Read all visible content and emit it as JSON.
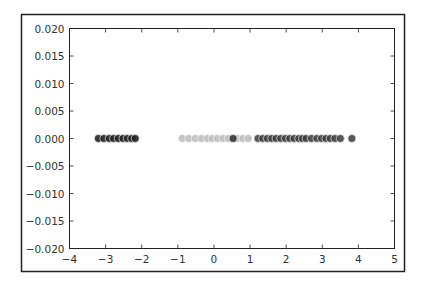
{
  "chart_data": {
    "type": "scatter",
    "title": "",
    "xlabel": "",
    "ylabel": "",
    "xlim": [
      -4,
      5
    ],
    "ylim": [
      -0.02,
      0.02
    ],
    "grid": false,
    "legend": "none",
    "xticks": [
      -4,
      -3,
      -2,
      -1,
      0,
      1,
      2,
      3,
      4,
      5
    ],
    "xtick_labels": [
      "−4",
      "−3",
      "−2",
      "−1",
      "0",
      "1",
      "2",
      "3",
      "4",
      "5"
    ],
    "yticks": [
      -0.02,
      -0.015,
      -0.01,
      -0.005,
      0,
      0.005,
      0.01,
      0.015,
      0.02
    ],
    "ytick_labels": [
      "−0.020",
      "−0.015",
      "−0.010",
      "−0.005",
      "0.000",
      "0.005",
      "0.010",
      "0.015",
      "0.020"
    ],
    "series": [
      {
        "name": "cluster-left",
        "color": "#222222",
        "alpha": 0.9,
        "x": [
          -3.2,
          -3.05,
          -2.9,
          -2.78,
          -2.65,
          -2.52,
          -2.4,
          -2.28,
          -2.18
        ],
        "y": [
          0,
          0,
          0,
          0,
          0,
          0,
          0,
          0,
          0
        ]
      },
      {
        "name": "cluster-middle-light",
        "color": "#bbbbbb",
        "alpha": 0.85,
        "x": [
          -0.88,
          -0.7,
          -0.52,
          -0.35,
          -0.18,
          -0.05,
          0.1,
          0.25,
          0.4,
          0.65,
          0.8,
          0.95
        ],
        "y": [
          0,
          0,
          0,
          0,
          0,
          0,
          0,
          0,
          0,
          0,
          0,
          0
        ]
      },
      {
        "name": "cluster-middle-dark",
        "color": "#333333",
        "alpha": 0.9,
        "x": [
          0.53
        ],
        "y": [
          0
        ]
      },
      {
        "name": "cluster-right",
        "color": "#3a3a3a",
        "alpha": 0.85,
        "x": [
          1.22,
          1.35,
          1.48,
          1.6,
          1.72,
          1.85,
          1.98,
          2.1,
          2.22,
          2.35,
          2.45,
          2.55,
          2.7,
          2.85,
          2.98,
          3.1,
          3.22,
          3.35,
          3.5,
          3.82
        ],
        "y": [
          0,
          0,
          0,
          0,
          0,
          0,
          0,
          0,
          0,
          0,
          0,
          0,
          0,
          0,
          0,
          0,
          0,
          0,
          0,
          0
        ]
      }
    ]
  }
}
